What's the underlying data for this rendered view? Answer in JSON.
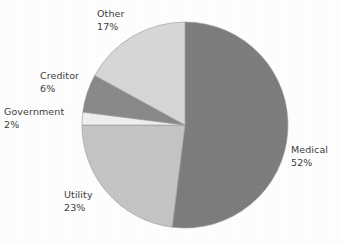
{
  "chart_data": {
    "type": "pie",
    "title": "",
    "subtitle": "",
    "xlabel": "",
    "ylabel": "",
    "legend": "none",
    "grid": false,
    "label_format": "name + percent, two lines, outside slices",
    "start_angle_deg": 0,
    "direction": "clockwise",
    "categories": [
      "Medical",
      "Utility",
      "Government",
      "Creditor",
      "Other"
    ],
    "values": [
      52,
      23,
      2,
      6,
      17
    ],
    "slices": [
      {
        "label": "Medical",
        "percent": 52,
        "percent_text": "52%",
        "color": "#7e7e7e"
      },
      {
        "label": "Utility",
        "percent": 23,
        "percent_text": "23%",
        "color": "#c5c5c5"
      },
      {
        "label": "Government",
        "percent": 2,
        "percent_text": "2%",
        "color": "#f0f0f0"
      },
      {
        "label": "Creditor",
        "percent": 6,
        "percent_text": "6%",
        "color": "#8a8a8a"
      },
      {
        "label": "Other",
        "percent": 17,
        "percent_text": "17%",
        "color": "#d8d8d8"
      }
    ]
  },
  "colors": {
    "background": "#ffffff",
    "text": "#3d3d3d",
    "slice_outline": "#9a9a9a",
    "medical": "#7e7e7e",
    "utility": "#c5c5c5",
    "government": "#f0f0f0",
    "creditor": "#8a8a8a",
    "other": "#d8d8d8"
  },
  "geometry": {
    "center_x": 185,
    "center_y": 125,
    "radius": 103
  }
}
